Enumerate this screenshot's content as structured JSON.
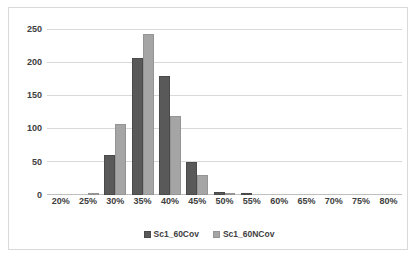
{
  "chart_data": {
    "type": "bar",
    "title": "",
    "xlabel": "",
    "ylabel": "",
    "categories": [
      "20%",
      "25%",
      "30%",
      "35%",
      "40%",
      "45%",
      "50%",
      "55%",
      "60%",
      "65%",
      "70%",
      "75%",
      "80%"
    ],
    "series": [
      {
        "name": "Sc1_60Cov",
        "color": "#595959",
        "values": [
          0,
          0,
          61,
          208,
          180,
          50,
          4,
          2,
          0,
          0,
          0,
          0,
          0
        ]
      },
      {
        "name": "Sc1_60NCov",
        "color": "#a5a5a5",
        "values": [
          0,
          3,
          107,
          244,
          119,
          30,
          2,
          0,
          0,
          0,
          0,
          0,
          0
        ]
      }
    ],
    "yticks": [
      0,
      50,
      100,
      150,
      200,
      250
    ],
    "ylim": [
      0,
      262
    ],
    "grid": true,
    "legend_position": "bottom"
  },
  "legend": {
    "items": [
      {
        "label": "Sc1_60Cov"
      },
      {
        "label": "Sc1_60NCov"
      }
    ]
  }
}
